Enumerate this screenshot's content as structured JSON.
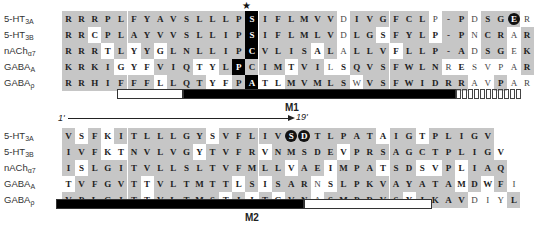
{
  "labels": [
    {
      "main": "5-HT",
      "sub": "3A"
    },
    {
      "main": "5-HT",
      "sub": "3B"
    },
    {
      "main": "nACh",
      "sub": "α7"
    },
    {
      "main": "GABA",
      "sub": "A"
    },
    {
      "main": "GABA",
      "sub": "ρ"
    }
  ],
  "top_block": {
    "star": "★",
    "rows": [
      "RRRPLFYAVSLLLPSIFLMVVDIVGFCLP-PDSGER",
      "RRCPLAYVVSLLIPSIFLMLVDLGSFYLP-PNCRAR",
      "RRRTLYYGLNLLIPCVLISALALLVFLLP-ADSGEK",
      "KRKIGYFVIQTYLPCIMTVILSQVSFWLNRESVPAR",
      "RRHIFFFLLQTYFPATLMVMLSWVSFWIDRRAVPAR"
    ],
    "shade": [
      "gggggggggggggbgggggggnggggggwgg ggngngg",
      "",
      "",
      "",
      ""
    ],
    "segment": "M1",
    "highlight_circle": {
      "row": 0,
      "col": 34,
      "residue": "E"
    }
  },
  "bottom_block": {
    "range_start": "1'",
    "range_end": "19'",
    "rows": [
      "VSFKITLLLGYSVFLIVSDTLPATAIGTPLIGV",
      "IVFKTNVLVGYTVFRVNMSDEVPRSAGCTPLIGV",
      "ISLGITVLLSLTVFMLLVAEIMPATSDSVPLIAQ",
      "TVFGVTTVLTMTTLSISARNSLPKVAYATAMDWFI",
      "VPLGITTVLTMSTIITGVNASMPRVSYIKAVDIYL"
    ],
    "segment": "M2",
    "highlight_circle": {
      "row": 0,
      "col": 17,
      "residue": "S"
    }
  }
}
